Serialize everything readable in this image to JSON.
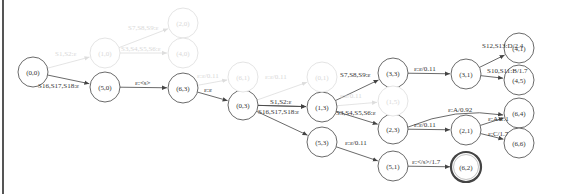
{
  "diagram": {
    "type": "weighted-fst-lattice",
    "nodes": [
      {
        "id": "n00",
        "label": "(0,0)",
        "x": 33,
        "y": 72,
        "faded": false,
        "final": false
      },
      {
        "id": "n50",
        "label": "(5,0)",
        "x": 105,
        "y": 87,
        "faded": false,
        "final": false
      },
      {
        "id": "n63",
        "label": "(6,3)",
        "x": 183,
        "y": 88,
        "faded": false,
        "final": false
      },
      {
        "id": "n03",
        "label": "(0,3)",
        "x": 243,
        "y": 105,
        "faded": false,
        "final": false
      },
      {
        "id": "n13",
        "label": "(1,3)",
        "x": 322,
        "y": 107,
        "faded": false,
        "final": false
      },
      {
        "id": "n33",
        "label": "(3,3)",
        "x": 393,
        "y": 73,
        "faded": false,
        "final": false
      },
      {
        "id": "n31",
        "label": "(3,1)",
        "x": 466,
        "y": 74,
        "faded": false,
        "final": false
      },
      {
        "id": "n41",
        "label": "(4,1)",
        "x": 519,
        "y": 48,
        "faded": false,
        "final": false
      },
      {
        "id": "n45",
        "label": "(4,5)",
        "x": 519,
        "y": 80,
        "faded": false,
        "final": false
      },
      {
        "id": "n53",
        "label": "(5,3)",
        "x": 322,
        "y": 142,
        "faded": false,
        "final": false
      },
      {
        "id": "n23",
        "label": "(2,3)",
        "x": 393,
        "y": 129,
        "faded": false,
        "final": false
      },
      {
        "id": "n21",
        "label": "(2,1)",
        "x": 466,
        "y": 130,
        "faded": false,
        "final": false
      },
      {
        "id": "n64",
        "label": "(6,4)",
        "x": 519,
        "y": 113,
        "faded": false,
        "final": false
      },
      {
        "id": "n66",
        "label": "(6,6)",
        "x": 519,
        "y": 143,
        "faded": false,
        "final": false
      },
      {
        "id": "n51",
        "label": "(5,1)",
        "x": 393,
        "y": 166,
        "faded": false,
        "final": false
      },
      {
        "id": "n62",
        "label": "(6,2)",
        "x": 466,
        "y": 167,
        "faded": false,
        "final": true
      },
      {
        "id": "f10",
        "label": "(1,0)",
        "x": 105,
        "y": 53,
        "faded": true,
        "final": false
      },
      {
        "id": "f20",
        "label": "(2,0)",
        "x": 183,
        "y": 23,
        "faded": true,
        "final": false
      },
      {
        "id": "f40",
        "label": "(4,0)",
        "x": 183,
        "y": 53,
        "faded": true,
        "final": false
      },
      {
        "id": "f60",
        "label": "(6,1)",
        "x": 243,
        "y": 77,
        "faded": true,
        "final": false
      },
      {
        "id": "f03",
        "label": "(0,1)",
        "x": 322,
        "y": 77,
        "faded": true,
        "final": false
      },
      {
        "id": "f15",
        "label": "(1,5)",
        "x": 393,
        "y": 101,
        "faded": true,
        "final": false
      }
    ],
    "edges": [
      {
        "from": "n00",
        "to": "n50",
        "label": "S16,S17,S18:ε",
        "lx": 38,
        "ly": 88,
        "faded": false
      },
      {
        "from": "n50",
        "to": "n63",
        "label": "ε:<s>",
        "lx": 135,
        "ly": 85,
        "faded": false
      },
      {
        "from": "n63",
        "to": "n03",
        "label": "ε:ε",
        "lx": 204,
        "ly": 92,
        "faded": false
      },
      {
        "from": "n03",
        "to": "n13",
        "label": "S1,S2:ε",
        "lx": 270,
        "ly": 104,
        "faded": false
      },
      {
        "from": "n03",
        "to": "n13",
        "label": "S16,S17,S18:ε",
        "lx": 258,
        "ly": 114,
        "faded": false
      },
      {
        "from": "n13",
        "to": "n33",
        "label": "S7,S8,S9:ε",
        "lx": 340,
        "ly": 77,
        "faded": false
      },
      {
        "from": "n13",
        "to": "n23",
        "label": "S3,S4,S5,S6:ε",
        "lx": 336,
        "ly": 115,
        "faded": false
      },
      {
        "from": "n03",
        "to": "n53",
        "label": "",
        "lx": 0,
        "ly": 0,
        "faded": false
      },
      {
        "from": "n33",
        "to": "n31",
        "label": "ε:ε/0.11",
        "lx": 414,
        "ly": 71,
        "faded": false
      },
      {
        "from": "n31",
        "to": "n41",
        "label": "S12,S13:D/2.4",
        "lx": 482,
        "ly": 48,
        "faded": false
      },
      {
        "from": "n31",
        "to": "n45",
        "label": "S10,S11:B/1.7",
        "lx": 487,
        "ly": 73,
        "faded": false
      },
      {
        "from": "n23",
        "to": "n21",
        "label": "ε:ε/0.11",
        "lx": 414,
        "ly": 127,
        "faded": false
      },
      {
        "from": "n23",
        "to": "n64",
        "label": "ε:A/0.92",
        "lx": 448,
        "ly": 112,
        "faded": false
      },
      {
        "from": "n21",
        "to": "n64",
        "label": "ε:A/1.1",
        "lx": 488,
        "ly": 121,
        "faded": false
      },
      {
        "from": "n21",
        "to": "n66",
        "label": "ε:C/1.7",
        "lx": 488,
        "ly": 136,
        "faded": false
      },
      {
        "from": "n53",
        "to": "n51",
        "label": "ε:ε/0.11",
        "lx": 345,
        "ly": 145,
        "faded": false
      },
      {
        "from": "n51",
        "to": "n62",
        "label": "ε:</s>/1.7",
        "lx": 412,
        "ly": 164,
        "faded": false
      },
      {
        "from": "n00",
        "to": "f10",
        "label": "S1,S2:ε",
        "lx": 55,
        "ly": 56,
        "faded": true
      },
      {
        "from": "f10",
        "to": "f20",
        "label": "S7,S8,S9:ε",
        "lx": 128,
        "ly": 30,
        "faded": true
      },
      {
        "from": "f10",
        "to": "f40",
        "label": "S3,S4,S5,S6:ε",
        "lx": 121,
        "ly": 51,
        "faded": true
      },
      {
        "from": "n63",
        "to": "f60",
        "label": "ε:ε/0.11",
        "lx": 197,
        "ly": 78,
        "faded": true
      },
      {
        "from": "n03",
        "to": "f03",
        "label": "ε:ε/0.11",
        "lx": 265,
        "ly": 79,
        "faded": true
      },
      {
        "from": "n13",
        "to": "f15",
        "label": "ε:ε/0.11",
        "lx": 340,
        "ly": 98,
        "faded": true
      }
    ]
  },
  "colors": {
    "active_stroke": "#444444",
    "faded_stroke": "#dddddd",
    "active_text": "#333333",
    "faded_text": "#d8d8d8",
    "border": "#555555"
  }
}
